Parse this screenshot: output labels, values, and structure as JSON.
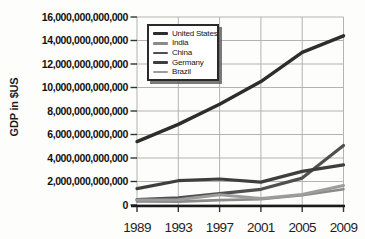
{
  "chart_data": {
    "type": "line",
    "title": "",
    "xlabel": "",
    "ylabel": "GDP in $US",
    "x": [
      1989,
      1993,
      1997,
      2001,
      2005,
      2009
    ],
    "xtick_labels": [
      "1989",
      "1993",
      "1997",
      "2001",
      "2005",
      "2009"
    ],
    "ylim": [
      0,
      16000000000000
    ],
    "ytick_step": 2000000000000,
    "ytick_labels_top_to_bottom": [
      "16,000,000,000,000",
      "14,000,000,000,000",
      "12,000,000,000,000",
      "10,000,000,000,000",
      "8,000,000,000,000",
      "6,000,000,000,000",
      "4,000,000,000,000",
      "2,000,000,000,000",
      "0"
    ],
    "grid": true,
    "legend_position": "top-left-inside",
    "series": [
      {
        "name": "United States",
        "color": "#2d2d2d",
        "stroke_width": 3.4,
        "values": [
          5400000000000,
          6860000000000,
          8580000000000,
          10500000000000,
          13000000000000,
          14400000000000
        ]
      },
      {
        "name": "India",
        "color": "#8a8a8a",
        "stroke_width": 2.6,
        "values": [
          300000000000,
          290000000000,
          420000000000,
          490000000000,
          830000000000,
          1340000000000
        ]
      },
      {
        "name": "China",
        "color": "#505050",
        "stroke_width": 3.2,
        "values": [
          450000000000,
          600000000000,
          960000000000,
          1340000000000,
          2290000000000,
          5060000000000
        ]
      },
      {
        "name": "Germany",
        "color": "#3e3e3e",
        "stroke_width": 3.2,
        "values": [
          1400000000000,
          2070000000000,
          2210000000000,
          1950000000000,
          2860000000000,
          3410000000000
        ]
      },
      {
        "name": "Brazil",
        "color": "#9c9c9c",
        "stroke_width": 3.0,
        "values": [
          430000000000,
          440000000000,
          880000000000,
          560000000000,
          890000000000,
          1660000000000
        ]
      }
    ],
    "colors": {
      "grid": "#b3b3b3",
      "axis": "#1a1a1a",
      "tick": "#333333"
    }
  }
}
